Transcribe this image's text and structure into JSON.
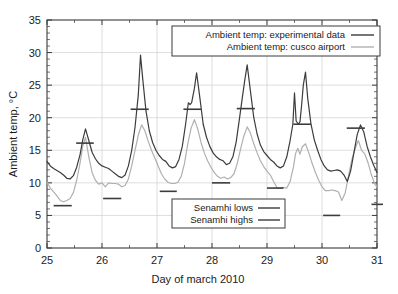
{
  "chart_data": {
    "type": "line",
    "title": "",
    "xlabel": "Day of march 2010",
    "ylabel": "Ambient temp, °C",
    "xlim": [
      25,
      31
    ],
    "ylim": [
      0,
      35
    ],
    "xticks": [
      "25",
      "26",
      "27",
      "28",
      "29",
      "30",
      "31"
    ],
    "yticks": [
      "0",
      "5",
      "10",
      "15",
      "20",
      "25",
      "30",
      "35"
    ],
    "grid": true,
    "legend_position": "top-right and bottom-center",
    "series": [
      {
        "name": "Ambient temp: experimental data",
        "color": "#3c3c3c",
        "x": [
          25.0,
          25.06,
          25.12,
          25.18,
          25.24,
          25.3,
          25.36,
          25.42,
          25.48,
          25.54,
          25.6,
          25.65,
          25.7,
          25.76,
          25.82,
          25.88,
          25.94,
          26.0,
          26.06,
          26.12,
          26.18,
          26.24,
          26.3,
          26.36,
          26.42,
          26.48,
          26.54,
          26.6,
          26.66,
          26.7,
          26.74,
          26.8,
          26.86,
          26.92,
          26.98,
          27.04,
          27.1,
          27.16,
          27.22,
          27.28,
          27.34,
          27.4,
          27.46,
          27.52,
          27.57,
          27.6,
          27.63,
          27.68,
          27.72,
          27.78,
          27.84,
          27.9,
          27.96,
          28.02,
          28.08,
          28.14,
          28.2,
          28.26,
          28.32,
          28.38,
          28.44,
          28.5,
          28.55,
          28.6,
          28.64,
          28.7,
          28.76,
          28.82,
          28.88,
          28.94,
          29.0,
          29.06,
          29.12,
          29.18,
          29.24,
          29.3,
          29.36,
          29.42,
          29.47,
          29.5,
          29.53,
          29.57,
          29.6,
          29.63,
          29.66,
          29.7,
          29.74,
          29.8,
          29.86,
          29.92,
          29.98,
          30.04,
          30.1,
          30.16,
          30.22,
          30.28,
          30.34,
          30.4,
          30.46,
          30.52,
          30.58,
          30.64,
          30.7,
          30.76,
          30.82,
          30.88,
          30.94,
          31.0
        ],
        "y": [
          13.3,
          12.6,
          12.2,
          11.9,
          11.6,
          11.2,
          10.7,
          10.6,
          11.1,
          12.4,
          14.3,
          16.6,
          18.3,
          16.5,
          14.7,
          13.7,
          13.0,
          12.6,
          12.4,
          12.2,
          11.8,
          11.4,
          11.0,
          10.8,
          11.2,
          12.6,
          15.0,
          18.5,
          23.5,
          29.6,
          26.0,
          21.0,
          18.0,
          16.2,
          15.0,
          14.2,
          13.6,
          13.3,
          12.6,
          12.3,
          12.5,
          13.6,
          15.6,
          19.0,
          22.3,
          22.0,
          22.3,
          24.5,
          26.9,
          23.0,
          19.0,
          17.0,
          15.6,
          14.6,
          14.0,
          13.6,
          13.4,
          12.8,
          13.0,
          14.0,
          16.3,
          19.9,
          23.0,
          26.0,
          28.1,
          24.0,
          20.0,
          17.5,
          15.8,
          14.8,
          14.2,
          13.6,
          13.2,
          12.6,
          12.3,
          12.6,
          14.0,
          16.5,
          19.0,
          23.8,
          19.5,
          19.0,
          19.4,
          22.0,
          25.0,
          27.0,
          23.0,
          19.0,
          16.6,
          15.0,
          13.6,
          12.6,
          12.0,
          11.8,
          11.9,
          12.0,
          11.8,
          11.2,
          10.2,
          11.8,
          14.6,
          17.4,
          18.9,
          17.8,
          15.6,
          14.0,
          12.7,
          11.6
        ]
      },
      {
        "name": "Ambient temp: cusco airport",
        "color": "#b0b0b0",
        "x": [
          25.0,
          25.06,
          25.12,
          25.18,
          25.24,
          25.3,
          25.36,
          25.42,
          25.48,
          25.54,
          25.6,
          25.65,
          25.7,
          25.76,
          25.82,
          25.88,
          25.94,
          26.0,
          26.06,
          26.12,
          26.18,
          26.24,
          26.3,
          26.36,
          26.42,
          26.48,
          26.54,
          26.6,
          26.66,
          26.72,
          26.78,
          26.84,
          26.9,
          26.96,
          27.02,
          27.08,
          27.14,
          27.2,
          27.26,
          27.32,
          27.38,
          27.44,
          27.5,
          27.56,
          27.62,
          27.68,
          27.74,
          27.8,
          27.86,
          27.92,
          27.98,
          28.04,
          28.1,
          28.16,
          28.22,
          28.28,
          28.34,
          28.4,
          28.46,
          28.52,
          28.58,
          28.64,
          28.7,
          28.76,
          28.82,
          28.88,
          28.94,
          29.0,
          29.06,
          29.12,
          29.18,
          29.24,
          29.3,
          29.36,
          29.42,
          29.48,
          29.52,
          29.56,
          29.6,
          29.64,
          29.7,
          29.76,
          29.82,
          29.88,
          29.94,
          30.0,
          30.06,
          30.12,
          30.18,
          30.24,
          30.3,
          30.36,
          30.42,
          30.48,
          30.54,
          30.6,
          30.66,
          30.72,
          30.78,
          30.84,
          30.9,
          30.96,
          31.0
        ],
        "y": [
          10.1,
          9.2,
          8.6,
          8.0,
          7.3,
          7.1,
          7.3,
          7.6,
          8.5,
          10.4,
          13.0,
          15.6,
          17.0,
          14.0,
          11.6,
          10.4,
          9.8,
          10.0,
          9.4,
          10.0,
          9.9,
          9.9,
          9.8,
          9.4,
          9.6,
          10.6,
          12.6,
          15.0,
          17.3,
          18.9,
          18.0,
          16.4,
          15.0,
          13.8,
          12.6,
          11.4,
          10.6,
          10.1,
          9.9,
          9.9,
          10.1,
          11.0,
          13.0,
          16.0,
          18.4,
          19.7,
          18.3,
          16.2,
          14.6,
          13.4,
          12.4,
          11.6,
          11.0,
          10.7,
          10.9,
          10.6,
          10.8,
          11.4,
          13.0,
          15.2,
          17.2,
          18.6,
          17.6,
          16.0,
          14.6,
          13.4,
          12.5,
          11.8,
          11.2,
          10.2,
          9.3,
          9.2,
          9.3,
          9.2,
          10.2,
          12.4,
          14.5,
          15.3,
          14.4,
          15.5,
          16.0,
          14.6,
          13.0,
          11.6,
          10.4,
          9.4,
          8.8,
          8.8,
          8.9,
          8.8,
          8.6,
          7.3,
          8.4,
          11.0,
          13.5,
          15.2,
          16.5,
          15.0,
          14.4,
          13.0,
          11.2,
          9.8,
          9.4
        ]
      }
    ],
    "markers": {
      "senamhi_lows": {
        "name": "Senamhi lows",
        "color": "#3c3c3c",
        "segments": [
          {
            "day_start": 25.12,
            "day_end": 25.45,
            "value": 6.5
          },
          {
            "day_start": 26.02,
            "day_end": 26.35,
            "value": 7.6
          },
          {
            "day_start": 27.05,
            "day_end": 27.36,
            "value": 8.7
          },
          {
            "day_start": 28.0,
            "day_end": 28.33,
            "value": 10.0
          },
          {
            "day_start": 29.0,
            "day_end": 29.3,
            "value": 9.2
          },
          {
            "day_start": 30.02,
            "day_end": 30.33,
            "value": 5.0
          },
          {
            "day_start": 30.9,
            "day_end": 31.18,
            "value": 6.7
          }
        ]
      },
      "senamhi_highs": {
        "name": "Senamhi highs",
        "color": "#3c3c3c",
        "segments": [
          {
            "day_start": 25.53,
            "day_end": 25.85,
            "value": 16.1
          },
          {
            "day_start": 26.52,
            "day_end": 26.85,
            "value": 21.3
          },
          {
            "day_start": 27.48,
            "day_end": 27.8,
            "value": 21.3
          },
          {
            "day_start": 28.45,
            "day_end": 28.78,
            "value": 21.4
          },
          {
            "day_start": 29.48,
            "day_end": 29.8,
            "value": 19.0
          },
          {
            "day_start": 30.45,
            "day_end": 30.78,
            "value": 18.4
          }
        ]
      }
    }
  },
  "legend_top": {
    "entries": [
      {
        "label": "Ambient temp: experimental data",
        "swatch": "dark"
      },
      {
        "label": "Ambient temp: cusco airport",
        "swatch": "light"
      }
    ]
  },
  "legend_bottom": {
    "entries": [
      {
        "label": "Senamhi lows",
        "swatch": "dark"
      },
      {
        "label": "Senamhi highs",
        "swatch": "dark"
      }
    ]
  },
  "axes": {
    "y_title": "Ambient temp, °C",
    "x_title": "Day of march 2010",
    "y_tick_labels": [
      "0",
      "5",
      "10",
      "15",
      "20",
      "25",
      "30",
      "35"
    ],
    "x_tick_labels": [
      "25",
      "26",
      "27",
      "28",
      "29",
      "30",
      "31"
    ]
  }
}
